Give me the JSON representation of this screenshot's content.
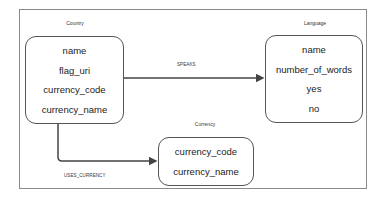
{
  "entities": {
    "country": {
      "title": "Country",
      "attributes": [
        "name",
        "flag_uri",
        "currency_code",
        "currency_name"
      ]
    },
    "language": {
      "title": "Language",
      "attributes": [
        "name",
        "number_of_words",
        "yes",
        "no"
      ]
    },
    "currency": {
      "title": "Currency",
      "attributes": [
        "currency_code",
        "currency_name"
      ]
    }
  },
  "relationships": {
    "speaks": {
      "label": "SPEAKS",
      "from": "Country",
      "to": "Language"
    },
    "uses_currency": {
      "label": "USES_CURRENCY",
      "from": "Country",
      "to": "Currency"
    }
  }
}
